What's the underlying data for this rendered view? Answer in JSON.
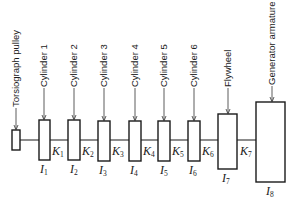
{
  "diagram": {
    "components": [
      {
        "id": "pulley",
        "label": "Torsiograph pulley",
        "x": 12,
        "y": 130,
        "w": 8,
        "h": 20,
        "inertia": null
      },
      {
        "id": "cyl1",
        "label": "Cylinder 1",
        "x": 39,
        "y": 120,
        "w": 11,
        "h": 40,
        "inertia": {
          "sym": "I",
          "sub": "1"
        }
      },
      {
        "id": "cyl2",
        "label": "Cylinder 2",
        "x": 68,
        "y": 120,
        "w": 12,
        "h": 40,
        "inertia": {
          "sym": "I",
          "sub": "2"
        }
      },
      {
        "id": "cyl3",
        "label": "Cylinder 3",
        "x": 98,
        "y": 121,
        "w": 12,
        "h": 40,
        "inertia": {
          "sym": "I",
          "sub": "3"
        }
      },
      {
        "id": "cyl4",
        "label": "Cylinder 4",
        "x": 129,
        "y": 121,
        "w": 12,
        "h": 40,
        "inertia": {
          "sym": "I",
          "sub": "4"
        }
      },
      {
        "id": "cyl5",
        "label": "Cylinder 5",
        "x": 158,
        "y": 121,
        "w": 12,
        "h": 40,
        "inertia": {
          "sym": "I",
          "sub": "5"
        }
      },
      {
        "id": "cyl6",
        "label": "Cylinder 6",
        "x": 188,
        "y": 121,
        "w": 12,
        "h": 40,
        "inertia": {
          "sym": "I",
          "sub": "6"
        }
      },
      {
        "id": "flywheel",
        "label": "Flywheel",
        "x": 218,
        "y": 114,
        "w": 19,
        "h": 55,
        "inertia": {
          "sym": "I",
          "sub": "7"
        }
      },
      {
        "id": "generator",
        "label": "Generator armature",
        "x": 256,
        "y": 102,
        "w": 29,
        "h": 80,
        "inertia": {
          "sym": "I",
          "sub": "8"
        }
      }
    ],
    "stiffness": [
      {
        "sym": "K",
        "sub": "1"
      },
      {
        "sym": "K",
        "sub": "2"
      },
      {
        "sym": "K",
        "sub": "3"
      },
      {
        "sym": "K",
        "sub": "4"
      },
      {
        "sym": "K",
        "sub": "5"
      },
      {
        "sym": "K",
        "sub": "6"
      },
      {
        "sym": "K",
        "sub": "7"
      }
    ],
    "colors": {
      "stroke": "#1a1a1a",
      "background": "#ffffff"
    }
  }
}
